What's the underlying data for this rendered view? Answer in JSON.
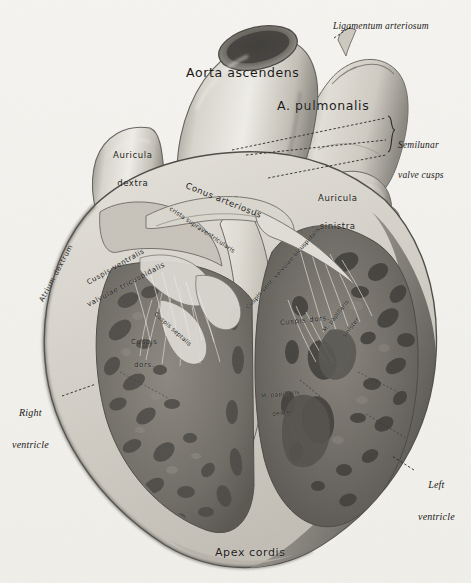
{
  "plate": {
    "title": "Heart, frontal section (Cor, sectio frontalis)",
    "background_color": "#f3f2ee",
    "ink_color": "#1b1a18",
    "width": 471,
    "height": 583
  },
  "labels": {
    "aorta_ascendens": "Aorta ascendens",
    "a_pulmonalis": "A. pulmonalis",
    "ligamentum_arteriosum": "Ligamentum arteriosum",
    "semilunar_valve_cusps_line1": "Semilunar",
    "semilunar_valve_cusps_line2": "valve cusps",
    "auricula_dextra_line1": "Auricula",
    "auricula_dextra_line2": "dextra",
    "auricula_sinistra_line1": "Auricula",
    "auricula_sinistra_line2": "sinistra",
    "conus_arteriosus": "Conus arteriosus",
    "crista_supraventricularis": "crista supraventricularis",
    "atrium_dextrum": "Atrium dextrum",
    "cuspis_ventralis": "Cuspis ventralis",
    "valvulae_tricuspidalis": "valvulae tricuspidalis",
    "cuspis_septalis": "Cuspis septalis",
    "cuspis_dorsalis_right_line1": "Cuspis",
    "cuspis_dorsalis_right_line2": "dors.",
    "cuspis_vent_valvulae_bicuspidalis": "Cuspis vent. valvulae bicuspidalis",
    "cuspis_dorsalis_left": "Cuspis dors.",
    "m_papillaris_sinister_line1": "M. papillaris",
    "m_papillaris_sinister_line2": "sinister",
    "m_papillaris_dexter_line1": "M. papillaris",
    "m_papillaris_dexter_line2": "dexter",
    "right_ventricle_line1": "Right",
    "right_ventricle_line2": "ventricle",
    "left_ventricle_line1": "Left",
    "left_ventricle_line2": "ventricle",
    "apex_cordis": "Apex cordis"
  }
}
